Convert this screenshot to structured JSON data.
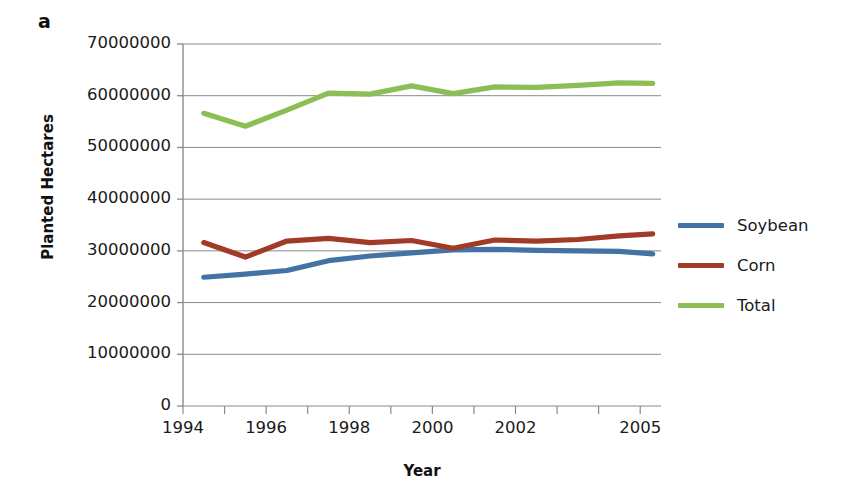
{
  "panel": {
    "letter": "a"
  },
  "axes": {
    "ylabel": "Planted Hectares",
    "xlabel": "Year",
    "ytick_labels": [
      "70000000",
      "60000000",
      "50000000",
      "40000000",
      "30000000",
      "20000000",
      "10000000",
      "0"
    ],
    "xtick_labels": [
      "1994",
      "1996",
      "1998",
      "2000",
      "2002",
      "2005"
    ]
  },
  "legend": {
    "items": [
      {
        "label": "Soybean",
        "color": "#4372A5"
      },
      {
        "label": "Corn",
        "color": "#A13A26"
      },
      {
        "label": "Total",
        "color": "#8CBE55"
      }
    ]
  },
  "chart_data": {
    "type": "line",
    "title": "",
    "xlabel": "Year",
    "ylabel": "Planted Hectares",
    "xlim": [
      1994,
      2005.5
    ],
    "ylim": [
      0,
      70000000
    ],
    "ytick_values": [
      0,
      10000000,
      20000000,
      30000000,
      40000000,
      50000000,
      60000000,
      70000000
    ],
    "xtick_values": [
      1994,
      1995,
      1996,
      1997,
      1998,
      1999,
      2000,
      2001,
      2002,
      2003,
      2004,
      2005
    ],
    "xtick_labels_shown": [
      "1994",
      "1996",
      "1998",
      "2000",
      "2002",
      "2005"
    ],
    "grid": "horizontal",
    "legend_position": "right",
    "x": [
      1994.5,
      1995.5,
      1996.5,
      1997.5,
      1998.5,
      1999.5,
      2000.5,
      2001.5,
      2002.5,
      2003.5,
      2004.5,
      2005.3
    ],
    "series": [
      {
        "name": "Soybean",
        "color": "#4372A5",
        "values": [
          24900000,
          25500000,
          26200000,
          28100000,
          29000000,
          29600000,
          30200000,
          30300000,
          30100000,
          30000000,
          29900000,
          29400000
        ]
      },
      {
        "name": "Corn",
        "color": "#A13A26",
        "values": [
          31600000,
          28800000,
          31900000,
          32400000,
          31600000,
          32000000,
          30500000,
          32100000,
          31900000,
          32200000,
          32900000,
          33300000
        ]
      },
      {
        "name": "Total",
        "color": "#8CBE55",
        "values": [
          56600000,
          54100000,
          57200000,
          60500000,
          60300000,
          61900000,
          60400000,
          61700000,
          61600000,
          62000000,
          62500000,
          62400000
        ]
      }
    ]
  }
}
